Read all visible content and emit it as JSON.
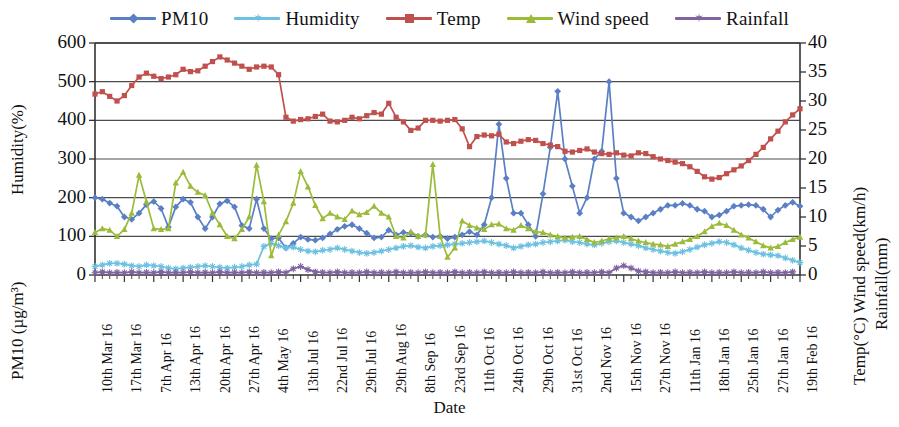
{
  "legend": {
    "items": [
      {
        "label": "PM10",
        "color": "#5b7fc4",
        "marker": "diamond",
        "icon": "legend-line-marker-icon"
      },
      {
        "label": "Humidity",
        "color": "#6cc0e0",
        "marker": "star",
        "icon": "legend-line-marker-icon"
      },
      {
        "label": "Temp",
        "color": "#c0504d",
        "marker": "square",
        "icon": "legend-line-marker-icon"
      },
      {
        "label": "Wind speed",
        "color": "#9bbb3a",
        "marker": "triangle",
        "icon": "legend-line-marker-icon"
      },
      {
        "label": "Rainfall",
        "color": "#8064a2",
        "marker": "star",
        "icon": "legend-line-marker-icon"
      }
    ]
  },
  "axes": {
    "left_title_top": "Humidity(%)",
    "left_title_bottom": "PM10 (µg/m³)",
    "right_title_left": "Temp(°C)  Wind speed(km/h)",
    "right_title_right": "Rainfall(mm)",
    "x_title": "Date",
    "left_ticks": [
      "600",
      "500",
      "400",
      "300",
      "200",
      "100",
      "0"
    ],
    "right_ticks": [
      "40",
      "35",
      "30",
      "25",
      "20",
      "15",
      "10",
      "5",
      "0"
    ],
    "left_range": [
      0,
      600
    ],
    "right_range": [
      0,
      40
    ]
  },
  "chart_data": {
    "type": "line",
    "title": "",
    "xlabel": "Date",
    "ylabel": "Humidity(%) / PM10 (µg/m³)",
    "y2label": "Temp(°C) / Wind speed(km/h) / Rainfall(mm)",
    "ylim": [
      0,
      600
    ],
    "y2lim": [
      0,
      40
    ],
    "grid": true,
    "legend_position": "top",
    "tick_labels": [
      "10th Mar 16",
      "17th Mar 16",
      "7th Apr 16",
      "13th Apr 16",
      "20th Apr 16",
      "27th Apr 16",
      "4th May 16",
      "13th Jul 16",
      "22nd Jul 16",
      "29th Jul 16",
      "29th Aug 16",
      "8th Sep 16",
      "23rd Sep 16",
      "11th Oct 16",
      "24th Oct 16",
      "29th Oct 16",
      "31st Oct 16",
      "2nd Nov 16",
      "15th Nov 16",
      "27th Nov 16",
      "11th Jan 16",
      "18th Jan 16",
      "25th Jan 16",
      "27th Jan 16",
      "19th Feb 16"
    ],
    "tick_every": 4,
    "n_points": 97,
    "series": [
      {
        "name": "PM10",
        "axis": "left",
        "unit": "µg/m³",
        "color": "#5b7fc4",
        "marker": "diamond",
        "values": [
          200,
          196,
          186,
          178,
          150,
          144,
          160,
          182,
          190,
          172,
          124,
          176,
          196,
          188,
          150,
          120,
          150,
          184,
          192,
          176,
          128,
          120,
          196,
          120,
          94,
          96,
          70,
          82,
          98,
          92,
          90,
          96,
          106,
          118,
          126,
          130,
          120,
          108,
          96,
          98,
          116,
          104,
          110,
          108,
          100,
          104,
          98,
          100,
          94,
          98,
          104,
          112,
          104,
          130,
          200,
          390,
          250,
          160,
          160,
          130,
          100,
          210,
          330,
          475,
          300,
          230,
          160,
          200,
          300,
          320,
          500,
          250,
          160,
          150,
          140,
          150,
          160,
          170,
          180,
          180,
          185,
          180,
          170,
          165,
          150,
          155,
          165,
          178,
          180,
          182,
          180,
          170,
          150,
          168,
          180,
          188,
          178
        ]
      },
      {
        "name": "Humidity",
        "axis": "left",
        "unit": "%",
        "color": "#6cc0e0",
        "marker": "star",
        "values": [
          22,
          26,
          30,
          30,
          28,
          24,
          22,
          26,
          24,
          22,
          18,
          16,
          18,
          20,
          22,
          24,
          22,
          20,
          18,
          20,
          22,
          26,
          28,
          74,
          82,
          76,
          70,
          72,
          66,
          62,
          60,
          64,
          66,
          70,
          66,
          62,
          58,
          56,
          58,
          62,
          66,
          70,
          74,
          76,
          72,
          70,
          74,
          76,
          78,
          80,
          82,
          84,
          86,
          88,
          84,
          80,
          76,
          70,
          74,
          78,
          80,
          84,
          86,
          88,
          90,
          86,
          84,
          80,
          78,
          82,
          86,
          88,
          84,
          80,
          76,
          70,
          66,
          62,
          58,
          56,
          60,
          66,
          72,
          78,
          82,
          86,
          84,
          78,
          70,
          64,
          58,
          54,
          52,
          50,
          44,
          38,
          32
        ]
      },
      {
        "name": "Temp",
        "axis": "right",
        "unit": "°C",
        "color": "#c0504d",
        "marker": "square",
        "values_scaled_left": [
          468,
          474,
          462,
          450,
          464,
          490,
          512,
          522,
          514,
          508,
          512,
          518,
          532,
          526,
          528,
          540,
          552,
          564,
          556,
          548,
          540,
          532,
          538,
          540,
          538,
          518,
          408,
          398,
          402,
          404,
          410,
          416,
          398,
          396,
          400,
          408,
          404,
          412,
          420,
          416,
          444,
          408,
          396,
          374,
          380,
          400,
          400,
          398,
          400,
          402,
          378,
          332,
          358,
          362,
          360,
          364,
          344,
          340,
          346,
          350,
          348,
          340,
          336,
          332,
          320,
          318,
          322,
          326,
          318,
          314,
          312,
          316,
          310,
          308,
          316,
          314,
          306,
          300,
          296,
          292,
          288,
          280,
          268,
          254,
          248,
          252,
          262,
          272,
          282,
          296,
          312,
          330,
          352,
          372,
          396,
          414,
          430
        ],
        "values": [
          31.2,
          31.6,
          30.8,
          30.0,
          30.9,
          32.7,
          34.1,
          34.8,
          34.3,
          33.9,
          34.1,
          34.5,
          35.5,
          35.1,
          35.2,
          36.0,
          36.8,
          37.6,
          37.1,
          36.5,
          36.0,
          35.5,
          35.9,
          36.0,
          35.9,
          34.5,
          27.2,
          26.5,
          26.8,
          26.9,
          27.3,
          27.7,
          26.5,
          26.4,
          26.7,
          27.2,
          26.9,
          27.5,
          28.0,
          27.7,
          29.6,
          27.2,
          26.4,
          24.9,
          25.3,
          26.7,
          26.7,
          26.5,
          26.7,
          26.8,
          25.2,
          22.1,
          23.9,
          24.1,
          24.0,
          24.3,
          22.9,
          22.7,
          23.1,
          23.3,
          23.2,
          22.7,
          22.4,
          22.1,
          21.3,
          21.2,
          21.5,
          21.7,
          21.2,
          20.9,
          20.8,
          21.1,
          20.7,
          20.5,
          21.1,
          20.9,
          20.4,
          20.0,
          19.7,
          19.5,
          19.2,
          18.7,
          17.9,
          16.9,
          16.5,
          16.8,
          17.5,
          18.1,
          18.8,
          19.7,
          20.8,
          22.0,
          23.5,
          24.8,
          26.4,
          27.6,
          28.7
        ]
      },
      {
        "name": "Wind speed",
        "axis": "right",
        "unit": "km/h",
        "color": "#9bbb3a",
        "marker": "triangle",
        "values_scaled_left": [
          110,
          120,
          116,
          100,
          118,
          160,
          258,
          190,
          120,
          118,
          120,
          238,
          266,
          230,
          214,
          206,
          160,
          130,
          100,
          94,
          118,
          150,
          284,
          190,
          50,
          104,
          138,
          186,
          268,
          228,
          180,
          146,
          160,
          150,
          144,
          166,
          156,
          162,
          178,
          160,
          150,
          100,
          96,
          112,
          100,
          104,
          286,
          100,
          46,
          70,
          140,
          128,
          122,
          118,
          130,
          132,
          120,
          116,
          128,
          120,
          112,
          110,
          104,
          100,
          96,
          98,
          100,
          92,
          84,
          88,
          94,
          96,
          100,
          94,
          88,
          84,
          80,
          78,
          74,
          80,
          86,
          92,
          100,
          112,
          126,
          134,
          128,
          116,
          104,
          96,
          86,
          76,
          70,
          74,
          84,
          92,
          98
        ],
        "values": [
          7.3,
          8.0,
          7.7,
          6.7,
          7.9,
          10.7,
          17.2,
          12.7,
          8.0,
          7.9,
          8.0,
          15.9,
          17.7,
          15.3,
          14.3,
          13.7,
          10.7,
          8.7,
          6.7,
          6.3,
          7.9,
          10.0,
          18.9,
          12.7,
          3.3,
          6.9,
          9.2,
          12.4,
          17.9,
          15.2,
          12.0,
          9.7,
          10.7,
          10.0,
          9.6,
          11.1,
          10.4,
          10.8,
          11.9,
          10.7,
          10.0,
          6.7,
          6.4,
          7.5,
          6.7,
          6.9,
          19.1,
          6.7,
          3.1,
          4.7,
          9.3,
          8.5,
          8.1,
          7.9,
          8.7,
          8.8,
          8.0,
          7.7,
          8.5,
          8.0,
          7.5,
          7.3,
          6.9,
          6.7,
          6.4,
          6.5,
          6.7,
          6.1,
          5.6,
          5.9,
          6.3,
          6.4,
          6.7,
          6.3,
          5.9,
          5.6,
          5.3,
          5.2,
          4.9,
          5.3,
          5.7,
          6.1,
          6.7,
          7.5,
          8.4,
          8.9,
          8.5,
          7.7,
          6.9,
          6.4,
          5.7,
          5.1,
          4.7,
          4.9,
          5.6,
          6.1,
          6.5
        ]
      },
      {
        "name": "Rainfall",
        "axis": "right",
        "unit": "mm",
        "color": "#8064a2",
        "marker": "star",
        "values_scaled_left": [
          6,
          8,
          6,
          7,
          6,
          8,
          6,
          7,
          6,
          8,
          6,
          7,
          6,
          8,
          6,
          7,
          6,
          8,
          6,
          7,
          6,
          8,
          6,
          7,
          6,
          8,
          6,
          16,
          22,
          14,
          8,
          7,
          6,
          8,
          6,
          7,
          6,
          8,
          6,
          7,
          6,
          8,
          6,
          7,
          6,
          8,
          6,
          7,
          6,
          8,
          6,
          7,
          6,
          8,
          6,
          7,
          6,
          8,
          6,
          7,
          6,
          8,
          6,
          7,
          6,
          8,
          6,
          7,
          6,
          8,
          6,
          18,
          24,
          18,
          10,
          8,
          6,
          7,
          6,
          8,
          6,
          7,
          6,
          8,
          6,
          7,
          6,
          8,
          6,
          7,
          6,
          8,
          6,
          7,
          6,
          8
        ],
        "values": [
          0.4,
          0.5,
          0.4,
          0.5,
          0.4,
          0.5,
          0.4,
          0.5,
          0.4,
          0.5,
          0.4,
          0.5,
          0.4,
          0.5,
          0.4,
          0.5,
          0.4,
          0.5,
          0.4,
          0.5,
          0.4,
          0.5,
          0.4,
          0.5,
          0.4,
          0.5,
          0.4,
          1.1,
          1.5,
          0.9,
          0.5,
          0.5,
          0.4,
          0.5,
          0.4,
          0.5,
          0.4,
          0.5,
          0.4,
          0.5,
          0.4,
          0.5,
          0.4,
          0.5,
          0.4,
          0.5,
          0.4,
          0.5,
          0.4,
          0.5,
          0.4,
          0.5,
          0.4,
          0.5,
          0.4,
          0.5,
          0.4,
          0.5,
          0.4,
          0.5,
          0.4,
          0.5,
          0.4,
          0.5,
          0.4,
          0.5,
          0.4,
          0.5,
          0.4,
          0.5,
          0.4,
          1.2,
          1.6,
          1.2,
          0.7,
          0.5,
          0.4,
          0.5,
          0.4,
          0.5,
          0.4,
          0.5,
          0.4,
          0.5,
          0.4,
          0.5,
          0.4,
          0.5,
          0.4,
          0.5,
          0.4,
          0.5,
          0.4,
          0.5,
          0.4,
          0.5
        ]
      }
    ]
  }
}
